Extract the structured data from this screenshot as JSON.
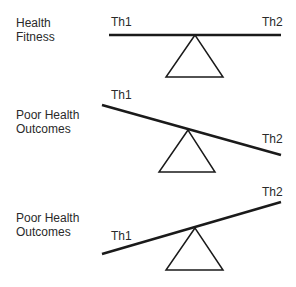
{
  "panels": [
    {
      "state_label_line1": "Health",
      "state_label_line2": "Fitness",
      "left_label": "Th1",
      "right_label": "Th2",
      "tilt": "balanced"
    },
    {
      "state_label_line1": "Poor Health",
      "state_label_line2": "Outcomes",
      "left_label": "Th1",
      "right_label": "Th2",
      "tilt": "right-down"
    },
    {
      "state_label_line1": "Poor Health",
      "state_label_line2": "Outcomes",
      "left_label": "Th1",
      "right_label": "Th2",
      "tilt": "left-down"
    }
  ],
  "colors": {
    "ink": "#1a1a1a",
    "text": "#2a2a2a",
    "background": "#ffffff"
  }
}
